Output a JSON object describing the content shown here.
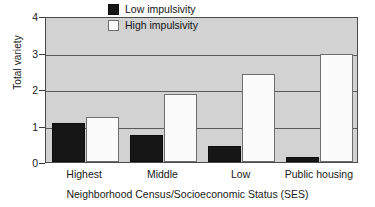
{
  "chart_data": {
    "type": "bar",
    "title": "",
    "categories": [
      "Highest",
      "Middle",
      "Low",
      "Public housing"
    ],
    "series": [
      {
        "name": "Low impulsivity",
        "values": [
          1.08,
          0.75,
          0.43,
          0.13
        ],
        "color": "#161616"
      },
      {
        "name": "High impulsivity",
        "values": [
          1.23,
          1.85,
          2.42,
          2.95
        ],
        "color": "#fbfbfb"
      }
    ],
    "xlabel": "Neighborhood Census/Socioeconomic Status (SES)",
    "ylabel": "Total variety",
    "ylim": [
      0,
      4
    ],
    "yticks": [
      0,
      1,
      2,
      3,
      4
    ],
    "ytick_labels": [
      "0",
      "1",
      "2",
      "3",
      "4"
    ],
    "grid": "horizontal",
    "legend_position": "top-center",
    "plot_background": "#d2d2d2",
    "figure_background": "#ffffff",
    "axis_color": "#4a4a4a",
    "gridline_color": "#5a5a5a"
  },
  "legend": {
    "entries": [
      {
        "label": "Low impulsivity",
        "swatch": "dark-square-icon"
      },
      {
        "label": "High impulsivity",
        "swatch": "light-square-icon"
      }
    ]
  }
}
